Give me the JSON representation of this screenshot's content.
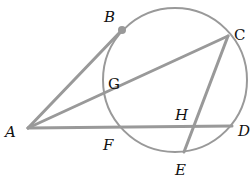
{
  "diagram": {
    "type": "geometry",
    "colors": {
      "line": "#999999",
      "label": "#111111",
      "background": "#ffffff"
    },
    "circle": {
      "cx": 175,
      "cy": 80,
      "r": 72
    },
    "points": [
      {
        "id": "A",
        "label": "A",
        "x": 28,
        "y": 128,
        "lx": 5,
        "ly": 137
      },
      {
        "id": "B",
        "label": "B",
        "x": 122,
        "y": 30,
        "lx": 104,
        "ly": 22
      },
      {
        "id": "C",
        "label": "C",
        "x": 228,
        "y": 36,
        "lx": 234,
        "ly": 40
      },
      {
        "id": "D",
        "label": "D",
        "x": 232,
        "y": 126,
        "lx": 238,
        "ly": 136
      },
      {
        "id": "E",
        "label": "E",
        "x": 184,
        "y": 152,
        "lx": 175,
        "ly": 175
      },
      {
        "id": "F",
        "label": "F",
        "x": 118,
        "y": 128,
        "lx": 103,
        "ly": 150
      },
      {
        "id": "G",
        "label": "G",
        "x": 108,
        "y": 96,
        "lx": 108,
        "ly": 89
      },
      {
        "id": "H",
        "label": "H",
        "x": 199,
        "y": 127,
        "lx": 175,
        "ly": 120
      }
    ],
    "segments": [
      {
        "from": "A",
        "to": "B",
        "name": "tangent-AB"
      },
      {
        "from": "A",
        "to": "C",
        "name": "secant-AC"
      },
      {
        "from": "A",
        "to": "D",
        "name": "secant-AD"
      },
      {
        "from": "C",
        "to": "E",
        "name": "chord-CE"
      }
    ],
    "tangent_point_marker": "B"
  }
}
